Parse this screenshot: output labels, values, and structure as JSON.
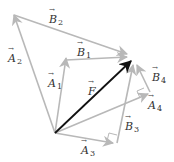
{
  "diagram": {
    "colors": {
      "resultant": "#111111",
      "component": "#b8b8b8",
      "label": "#333333",
      "background": "#ffffff"
    },
    "origin": [
      55,
      133
    ],
    "resultant": {
      "name": "F",
      "label": "F",
      "from": [
        55,
        133
      ],
      "to": [
        132,
        60
      ]
    },
    "components": [
      {
        "name": "A1",
        "symbol": "A",
        "sub": "1",
        "from": [
          55,
          133
        ],
        "to": [
          66,
          60
        ]
      },
      {
        "name": "B1",
        "symbol": "B",
        "sub": "1",
        "from": [
          66,
          60
        ],
        "to": [
          128,
          57
        ]
      },
      {
        "name": "A2",
        "symbol": "A",
        "sub": "2",
        "from": [
          55,
          133
        ],
        "to": [
          14,
          15
        ]
      },
      {
        "name": "B2",
        "symbol": "B",
        "sub": "2",
        "from": [
          14,
          15
        ],
        "to": [
          128,
          54
        ]
      },
      {
        "name": "A3",
        "symbol": "A",
        "sub": "3",
        "from": [
          55,
          133
        ],
        "to": [
          113,
          143
        ]
      },
      {
        "name": "B3",
        "symbol": "B",
        "sub": "3",
        "from": [
          117,
          142
        ],
        "to": [
          133,
          64
        ]
      },
      {
        "name": "A4",
        "symbol": "A",
        "sub": "4",
        "from": [
          55,
          133
        ],
        "to": [
          148,
          94
        ]
      },
      {
        "name": "B4",
        "symbol": "B",
        "sub": "4",
        "from": [
          150,
          92
        ],
        "to": [
          137,
          64
        ]
      }
    ],
    "labels": {
      "F": {
        "symbol": "F",
        "sub": ""
      },
      "A1": {
        "symbol": "A",
        "sub": "1"
      },
      "B1": {
        "symbol": "B",
        "sub": "1"
      },
      "A2": {
        "symbol": "A",
        "sub": "2"
      },
      "B2": {
        "symbol": "B",
        "sub": "2"
      },
      "A3": {
        "symbol": "A",
        "sub": "3"
      },
      "B3": {
        "symbol": "B",
        "sub": "3"
      },
      "A4": {
        "symbol": "A",
        "sub": "4"
      },
      "B4": {
        "symbol": "B",
        "sub": "4"
      }
    },
    "right_angle_markers": [
      "A3-B3",
      "A4-B4"
    ]
  }
}
